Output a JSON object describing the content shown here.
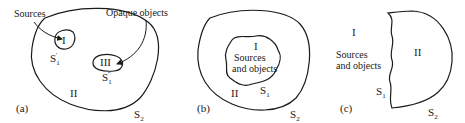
{
  "figure": {
    "panels": [
      {
        "id": "a",
        "label": "(a)",
        "annotations": {
          "sources": "Sources",
          "opaque_objects": "Opaque objects"
        },
        "regions": {
          "inner_source": "I",
          "outer": "II",
          "inner_object": "III"
        },
        "surfaces": {
          "source_surface": {
            "base": "S",
            "sub": "1",
            "prime": "′"
          },
          "object_surface": {
            "base": "S",
            "sub": "1",
            "prime": "″"
          },
          "outer_surface": {
            "base": "S",
            "sub": "2"
          }
        }
      },
      {
        "id": "b",
        "label": "(b)",
        "regions": {
          "inner": "I",
          "outer": "II"
        },
        "inner_text": [
          "Sources",
          "and objects"
        ],
        "surfaces": {
          "inner_surface": {
            "base": "S",
            "sub": "1"
          },
          "outer_surface": {
            "base": "S",
            "sub": "2"
          }
        }
      },
      {
        "id": "c",
        "label": "(c)",
        "regions": {
          "left": "I",
          "right": "II"
        },
        "left_text": [
          "Sources",
          "and objects"
        ],
        "surfaces": {
          "inner_surface": {
            "base": "S",
            "sub": "1"
          },
          "outer_surface": {
            "base": "S",
            "sub": "2"
          }
        }
      }
    ],
    "colors": {
      "stroke": "#1a1a1a",
      "background": "#ffffff"
    }
  }
}
